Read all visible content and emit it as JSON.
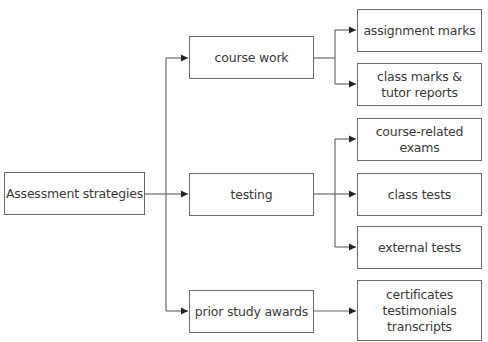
{
  "diagram": {
    "type": "tree",
    "colors": {
      "line": "#6b6b6b",
      "text": "#3a3a3a",
      "background": "#ffffff"
    },
    "root": {
      "label": "Assessment strategies"
    },
    "branches": [
      {
        "label": "course work",
        "children": [
          {
            "label": "assignment marks"
          },
          {
            "label": "class marks &\ntutor reports"
          }
        ]
      },
      {
        "label": "testing",
        "children": [
          {
            "label": "course-related\nexams"
          },
          {
            "label": "class tests"
          },
          {
            "label": "external tests"
          }
        ]
      },
      {
        "label": "prior study awards",
        "children": [
          {
            "label": "certificates\ntestimonials\ntranscripts"
          }
        ]
      }
    ]
  }
}
